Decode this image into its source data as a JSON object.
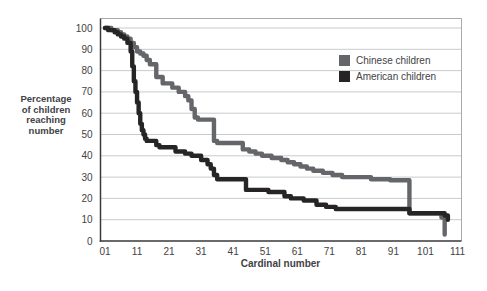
{
  "page": {
    "background": "#ffffff"
  },
  "colors": {
    "grid": "#c9cacc",
    "axis_dark": "#39393b",
    "frame_light": "#a8a9ab",
    "text": "#424245",
    "chinese_line": "#65666a",
    "american_line": "#272425"
  },
  "chart_data": {
    "type": "line",
    "subtype": "step-after",
    "title": "",
    "xlabel": "Cardinal number",
    "ylabel": "Percentage of children reaching number",
    "ylabel_lines": [
      "Percentage",
      "of children",
      "reaching",
      "number"
    ],
    "xlim": [
      1,
      111
    ],
    "ylim": [
      0,
      100
    ],
    "grid": true,
    "legend_position": "top-right-inside",
    "x_tick_values": [
      1,
      11,
      21,
      31,
      41,
      51,
      61,
      71,
      81,
      91,
      101,
      111
    ],
    "x_tick_labels": [
      "01",
      "11",
      "21",
      "31",
      "41",
      "51",
      "61",
      "71",
      "81",
      "91",
      "101",
      "111"
    ],
    "y_tick_values": [
      0,
      10,
      20,
      30,
      40,
      50,
      60,
      70,
      80,
      90,
      100
    ],
    "y_tick_labels": [
      "0",
      "10",
      "20",
      "30",
      "40",
      "50",
      "60",
      "70",
      "80",
      "90",
      "100"
    ],
    "series": [
      {
        "name": "Chinese children",
        "color": "#65666a",
        "points": [
          [
            1,
            100
          ],
          [
            3,
            99
          ],
          [
            5,
            98
          ],
          [
            6,
            97
          ],
          [
            7,
            96
          ],
          [
            8,
            95
          ],
          [
            9,
            93
          ],
          [
            10,
            91
          ],
          [
            11,
            89
          ],
          [
            12,
            88
          ],
          [
            13,
            87
          ],
          [
            14,
            85
          ],
          [
            15,
            83
          ],
          [
            17,
            77
          ],
          [
            19,
            74
          ],
          [
            22,
            72
          ],
          [
            24,
            70
          ],
          [
            26,
            68
          ],
          [
            27,
            66
          ],
          [
            28,
            62
          ],
          [
            29,
            58
          ],
          [
            30,
            57
          ],
          [
            35,
            47
          ],
          [
            36,
            46
          ],
          [
            44,
            43
          ],
          [
            46,
            42
          ],
          [
            48,
            41
          ],
          [
            50,
            40
          ],
          [
            53,
            39
          ],
          [
            56,
            38
          ],
          [
            58,
            37
          ],
          [
            60,
            36
          ],
          [
            62,
            35
          ],
          [
            64,
            34
          ],
          [
            66,
            33
          ],
          [
            69,
            32
          ],
          [
            72,
            31
          ],
          [
            75,
            30
          ],
          [
            84,
            29
          ],
          [
            90,
            28.5
          ],
          [
            96,
            13
          ],
          [
            106,
            11
          ],
          [
            107,
            3
          ]
        ]
      },
      {
        "name": "American children",
        "color": "#272425",
        "points": [
          [
            1,
            100
          ],
          [
            2,
            99
          ],
          [
            4,
            98
          ],
          [
            5,
            97
          ],
          [
            6,
            96
          ],
          [
            7,
            95
          ],
          [
            8,
            93
          ],
          [
            9,
            89
          ],
          [
            9.5,
            82
          ],
          [
            10,
            75
          ],
          [
            10.5,
            70
          ],
          [
            11,
            65
          ],
          [
            11.5,
            60
          ],
          [
            12,
            55
          ],
          [
            12.5,
            52
          ],
          [
            13,
            50
          ],
          [
            13.5,
            48
          ],
          [
            14,
            47
          ],
          [
            17,
            45
          ],
          [
            18,
            44
          ],
          [
            23,
            42
          ],
          [
            26,
            41
          ],
          [
            28,
            40
          ],
          [
            31,
            38
          ],
          [
            33,
            36
          ],
          [
            34,
            34
          ],
          [
            35,
            31
          ],
          [
            36,
            29
          ],
          [
            45,
            24
          ],
          [
            52,
            23
          ],
          [
            57,
            21
          ],
          [
            59,
            20
          ],
          [
            63,
            19
          ],
          [
            67,
            17
          ],
          [
            70,
            16
          ],
          [
            73,
            15
          ],
          [
            96,
            13
          ],
          [
            107,
            12
          ],
          [
            108,
            10
          ]
        ]
      }
    ]
  }
}
